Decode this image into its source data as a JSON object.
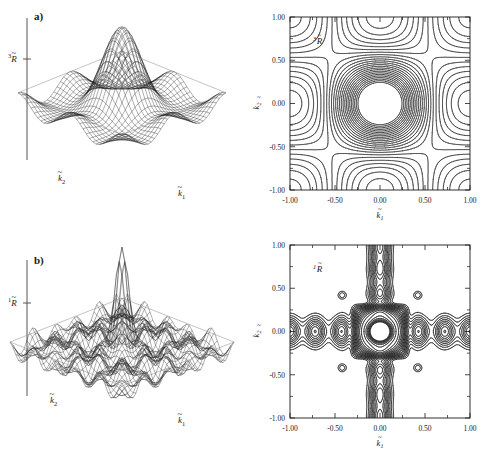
{
  "figure": {
    "background": "#ffffff",
    "ink": "#1a1a1a"
  },
  "panels": [
    {
      "id": "a",
      "label": "a)",
      "surface": {
        "vertical_axis_label": "3R",
        "vertical_axis_superscript": "3",
        "vertical_axis_symbol": "R",
        "vertical_axis_tilde": "~",
        "x_axis_label": "k1",
        "x_axis_symbol": "k",
        "x_axis_subscript": "1",
        "y_axis_label": "k2",
        "y_axis_symbol": "k",
        "y_axis_subscript": "2",
        "description": "broad single central peak on an undulating base"
      },
      "contour": {
        "in_plot_label": "3R",
        "in_plot_superscript": "3",
        "in_plot_symbol": "R",
        "xlabel_symbol": "k",
        "xlabel_subscript": "1",
        "ylabel_symbol": "k",
        "ylabel_subscript": "2",
        "xticks": [
          "-1.00",
          "-0.50",
          "0.00",
          "0.50",
          "1.00"
        ],
        "yticks": [
          "1.00",
          "0.50",
          "0.00",
          "-0.50",
          "-1.00"
        ],
        "xlim": [
          -1.0,
          1.0
        ],
        "ylim": [
          -1.0,
          1.0
        ]
      }
    },
    {
      "id": "b",
      "label": "b)",
      "surface": {
        "vertical_axis_label": "1R",
        "vertical_axis_superscript": "1",
        "vertical_axis_symbol": "R",
        "vertical_axis_tilde": "~",
        "x_axis_label": "k1",
        "x_axis_symbol": "k",
        "x_axis_subscript": "1",
        "y_axis_label": "k2",
        "y_axis_symbol": "k",
        "y_axis_subscript": "2",
        "description": "narrow tall central spike on a rippled corrugated base"
      },
      "contour": {
        "in_plot_label": "1R",
        "in_plot_superscript": "1",
        "in_plot_symbol": "R",
        "xlabel_symbol": "k",
        "xlabel_subscript": "1",
        "ylabel_symbol": "k",
        "ylabel_subscript": "2",
        "xticks": [
          "-1.00",
          "-0.50",
          "0.00",
          "0.50",
          "1.00"
        ],
        "yticks": [
          "1.00",
          "0.50",
          "0.00",
          "-0.50",
          "-1.00"
        ],
        "xlim": [
          -1.0,
          1.0
        ],
        "ylim": [
          -1.0,
          1.0
        ]
      }
    }
  ],
  "chart_data": [
    {
      "type": "surface",
      "panel": "a",
      "title": "3R tilde surface",
      "xlabel": "k1 tilde",
      "ylabel": "k2 tilde",
      "zlabel": "3R tilde",
      "xlim": [
        -1.0,
        1.0
      ],
      "ylim": [
        -1.0,
        1.0
      ],
      "grid": false,
      "function": "broad_gaussian_plus_cosine_base",
      "nx": 33,
      "ny": 33,
      "peak_height": 1.0,
      "peak_center": [
        0.0,
        0.0
      ],
      "peak_width": 0.42,
      "ripple_amplitude": 0.16,
      "ripple_frequency": 2.0
    },
    {
      "type": "contour",
      "panel": "a",
      "title": "3R tilde contour map",
      "xlabel": "k1 tilde",
      "ylabel": "k2 tilde",
      "xlim": [
        -1.0,
        1.0
      ],
      "ylim": [
        -1.0,
        1.0
      ],
      "xticks": [
        -1.0,
        -0.5,
        0.0,
        0.5,
        1.0
      ],
      "yticks": [
        -1.0,
        -0.5,
        0.0,
        0.5,
        1.0
      ],
      "xticklabels": [
        "-1.00",
        "-0.50",
        "0.00",
        "0.50",
        "1.00"
      ],
      "yticklabels": [
        "-1.00",
        "-0.50",
        "0.00",
        "0.50",
        "1.00"
      ],
      "grid": false,
      "n_levels": 24,
      "structure": "central rounded-square nest of ~20 concentric contours centred on origin, plus partial lobes entering from all four edges and small arcs in the four corners",
      "satellite_centers": [
        [
          0.0,
          1.0
        ],
        [
          0.0,
          -1.0
        ],
        [
          1.0,
          0.0
        ],
        [
          -1.0,
          0.0
        ]
      ],
      "corner_arcs": [
        [
          1.0,
          1.0
        ],
        [
          1.0,
          -1.0
        ],
        [
          -1.0,
          1.0
        ],
        [
          -1.0,
          -1.0
        ]
      ]
    },
    {
      "type": "surface",
      "panel": "b",
      "title": "1R tilde surface",
      "xlabel": "k1 tilde",
      "ylabel": "k2 tilde",
      "zlabel": "1R tilde",
      "xlim": [
        -1.0,
        1.0
      ],
      "ylim": [
        -1.0,
        1.0
      ],
      "grid": false,
      "function": "narrow_spike_plus_ripples",
      "nx": 41,
      "ny": 41,
      "peak_height": 1.0,
      "peak_center": [
        0.0,
        0.0
      ],
      "peak_width": 0.13,
      "ripple_amplitude": 0.12,
      "ripple_frequency": 5.0
    },
    {
      "type": "contour",
      "panel": "b",
      "title": "1R tilde contour map",
      "xlabel": "k1 tilde",
      "ylabel": "k2 tilde",
      "xlim": [
        -1.0,
        1.0
      ],
      "ylim": [
        -1.0,
        1.0
      ],
      "xticks": [
        -1.0,
        -0.5,
        0.0,
        0.5,
        1.0
      ],
      "yticks": [
        -1.0,
        -0.5,
        0.0,
        0.5,
        1.0
      ],
      "xticklabels": [
        "-1.00",
        "-0.50",
        "0.00",
        "0.50",
        "1.00"
      ],
      "yticklabels": [
        "-1.00",
        "-0.50",
        "0.00",
        "0.50",
        "1.00"
      ],
      "grid": false,
      "n_levels": 22,
      "structure": "dense dark core block at origin with fine concentric rings; rows of elongated oval satellites along the k1=0 and k2=0 axes; small isolated rings at the diagonal positions (+-0.42,+-0.42)",
      "core_half_width": 0.3,
      "axis_satellites_x": [
        -1.0,
        -0.72,
        -0.42,
        0.42,
        0.72,
        1.0
      ],
      "axis_satellites_y": [
        -1.0,
        -0.72,
        -0.42,
        0.42,
        0.72,
        1.0
      ],
      "diagonal_dots": [
        [
          -0.42,
          0.42
        ],
        [
          0.42,
          0.42
        ],
        [
          -0.42,
          -0.42
        ],
        [
          0.42,
          -0.42
        ]
      ]
    }
  ]
}
